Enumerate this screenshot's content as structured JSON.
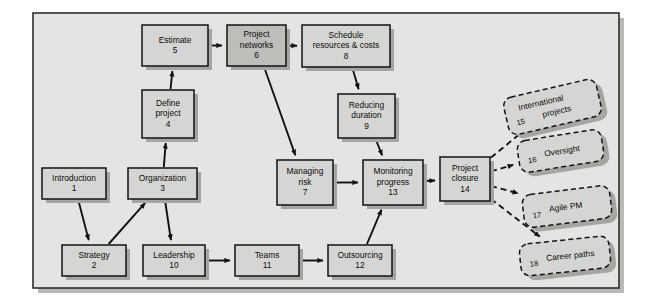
{
  "diagram": {
    "type": "flowchart",
    "frame": {
      "fill": "#e4e4e2",
      "border": "#2e2e2e",
      "shadow": "#b9b9b6"
    },
    "style": {
      "node_fill": "#d5d5d3",
      "node_fill_dark": "#bdbdba",
      "node_border": "#121212",
      "node_shadow": "#a5a5a2",
      "arrow_color": "#111111",
      "dashed_border": "#141414",
      "dashed_fill": "#d5d5d3"
    },
    "nodes": [
      {
        "id": "n1",
        "line1": "Introduction",
        "line2": "",
        "number": "1",
        "x": 42,
        "y": 168,
        "w": 64,
        "h": 31,
        "shade": "light"
      },
      {
        "id": "n2",
        "line1": "Strategy",
        "line2": "",
        "number": "2",
        "x": 62,
        "y": 245,
        "w": 64,
        "h": 31,
        "shade": "light"
      },
      {
        "id": "n3",
        "line1": "Organization",
        "line2": "",
        "number": "3",
        "x": 128,
        "y": 168,
        "w": 69,
        "h": 31,
        "shade": "light"
      },
      {
        "id": "n4",
        "line1": "Define",
        "line2": "project",
        "number": "4",
        "x": 142,
        "y": 90,
        "w": 52,
        "h": 48,
        "shade": "light"
      },
      {
        "id": "n5",
        "line1": "Estimate",
        "line2": "",
        "number": "5",
        "x": 142,
        "y": 25,
        "w": 66,
        "h": 41,
        "shade": "light"
      },
      {
        "id": "n6",
        "line1": "Project",
        "line2": "networks",
        "number": "6",
        "x": 227,
        "y": 25,
        "w": 59,
        "h": 41,
        "shade": "dark"
      },
      {
        "id": "n7",
        "line1": "Managing",
        "line2": "risk",
        "number": "7",
        "x": 277,
        "y": 160,
        "w": 56,
        "h": 45,
        "shade": "light"
      },
      {
        "id": "n8",
        "line1": "Schedule",
        "line2": "resources & costs",
        "number": "8",
        "x": 302,
        "y": 25,
        "w": 88,
        "h": 42,
        "shade": "light"
      },
      {
        "id": "n9",
        "line1": "Reducing",
        "line2": "duration",
        "number": "9",
        "x": 338,
        "y": 94,
        "w": 57,
        "h": 44,
        "shade": "light"
      },
      {
        "id": "n10",
        "line1": "Leadership",
        "line2": "",
        "number": "10",
        "x": 143,
        "y": 245,
        "w": 62,
        "h": 31,
        "shade": "light"
      },
      {
        "id": "n11",
        "line1": "Teams",
        "line2": "",
        "number": "11",
        "x": 235,
        "y": 245,
        "w": 64,
        "h": 31,
        "shade": "light"
      },
      {
        "id": "n12",
        "line1": "Outsourcing",
        "line2": "",
        "number": "12",
        "x": 328,
        "y": 245,
        "w": 64,
        "h": 31,
        "shade": "light"
      },
      {
        "id": "n13",
        "line1": "Monitoring",
        "line2": "progress",
        "number": "13",
        "x": 363,
        "y": 160,
        "w": 60,
        "h": 45,
        "shade": "light"
      },
      {
        "id": "n14",
        "line1": "Project",
        "line2": "closure",
        "number": "14",
        "x": 440,
        "y": 157,
        "w": 50,
        "h": 44,
        "shade": "light"
      }
    ],
    "dashed_nodes": [
      {
        "id": "d15",
        "number": "15",
        "label1": "International",
        "label2": "projects",
        "x": 505,
        "y": 88,
        "w": 95,
        "h": 38,
        "rotate": -13
      },
      {
        "id": "d16",
        "number": "16",
        "label1": "Oversight",
        "label2": "",
        "x": 518,
        "y": 135,
        "w": 85,
        "h": 32,
        "rotate": -9
      },
      {
        "id": "d17",
        "number": "17",
        "label1": "Agile PM",
        "label2": "",
        "x": 523,
        "y": 190,
        "w": 88,
        "h": 33,
        "rotate": -7
      },
      {
        "id": "d18",
        "number": "18",
        "label1": "Career paths",
        "label2": "",
        "x": 520,
        "y": 240,
        "w": 90,
        "h": 32,
        "rotate": -6
      }
    ],
    "edges": [
      {
        "from": "n1",
        "to": "n2",
        "style": "solid"
      },
      {
        "from": "n2",
        "to": "n3",
        "style": "solid"
      },
      {
        "from": "n3",
        "to": "n4",
        "style": "solid"
      },
      {
        "from": "n3",
        "to": "n10",
        "style": "solid"
      },
      {
        "from": "n4",
        "to": "n5",
        "style": "solid"
      },
      {
        "from": "n5",
        "to": "n6",
        "style": "solid"
      },
      {
        "from": "n6",
        "to": "n8",
        "style": "solid"
      },
      {
        "from": "n6",
        "to": "n7",
        "style": "solid"
      },
      {
        "from": "n8",
        "to": "n9",
        "style": "solid"
      },
      {
        "from": "n9",
        "to": "n13",
        "style": "solid"
      },
      {
        "from": "n7",
        "to": "n13",
        "style": "solid"
      },
      {
        "from": "n10",
        "to": "n11",
        "style": "solid"
      },
      {
        "from": "n11",
        "to": "n12",
        "style": "solid"
      },
      {
        "from": "n12",
        "to": "n13",
        "style": "solid"
      },
      {
        "from": "n13",
        "to": "n14",
        "style": "solid"
      },
      {
        "from": "n14",
        "to": "d15",
        "style": "dashed"
      },
      {
        "from": "n14",
        "to": "d16",
        "style": "dashed"
      },
      {
        "from": "n14",
        "to": "d17",
        "style": "dashed"
      },
      {
        "from": "n14",
        "to": "d18",
        "style": "dashed"
      }
    ]
  }
}
